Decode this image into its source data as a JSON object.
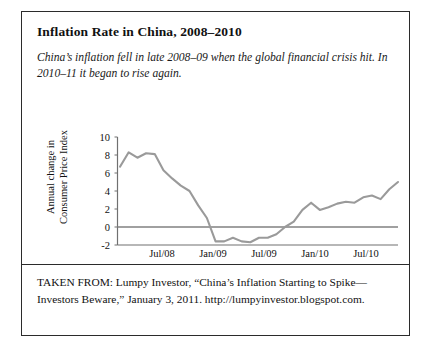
{
  "figure": {
    "title": "Inflation Rate in China, 2008–2010",
    "caption": "China’s inflation fell in late 2008–09 when the global financial crisis hit. In 2010–11 it began to rise again.",
    "source_note": "TAKEN FROM: Lumpy Investor, “China’s Inflation Starting to Spike—Investors Beware,” January 3, 2011. http://lumpyinvestor.blogspot.com.",
    "border_color": "#2b2b2b",
    "background_color": "#ffffff"
  },
  "chart_data": {
    "type": "line",
    "title": "Inflation Rate in China, 2008–2010",
    "xlabel": "",
    "ylabel": "Annual change in Consumer Price Index",
    "ylabel_line1": "Annual change in",
    "ylabel_line2": "Consumer Price Index",
    "ylim": [
      -2,
      10
    ],
    "yticks": [
      10,
      8,
      6,
      4,
      2,
      0,
      -2
    ],
    "ytick_labels": [
      "10",
      "8",
      "6",
      "4",
      "2",
      "0",
      "-2"
    ],
    "xtick_labels": [
      "Jul/08",
      "Jan/09",
      "Jul/09",
      "Jan/10",
      "Jul/10"
    ],
    "xtick_months": [
      "2008-07",
      "2009-01",
      "2009-07",
      "2010-01",
      "2010-07"
    ],
    "xlim": [
      "2008-03",
      "2010-12"
    ],
    "grid": false,
    "legend": false,
    "zero_line": true,
    "line_color": "#9a9a9a",
    "axis_color": "#707070",
    "series": [
      {
        "name": "Annual change in Consumer Price Index",
        "x": [
          "2008-03",
          "2008-04",
          "2008-05",
          "2008-06",
          "2008-07",
          "2008-08",
          "2008-09",
          "2008-10",
          "2008-11",
          "2008-12",
          "2009-01",
          "2009-02",
          "2009-03",
          "2009-04",
          "2009-05",
          "2009-06",
          "2009-07",
          "2009-08",
          "2009-09",
          "2009-10",
          "2009-11",
          "2009-12",
          "2010-01",
          "2010-02",
          "2010-03",
          "2010-04",
          "2010-05",
          "2010-06",
          "2010-07",
          "2010-08",
          "2010-09",
          "2010-10",
          "2010-11"
        ],
        "values": [
          6.7,
          8.3,
          7.7,
          8.2,
          8.1,
          6.3,
          5.4,
          4.6,
          4.0,
          2.4,
          1.0,
          -1.6,
          -1.6,
          -1.2,
          -1.6,
          -1.7,
          -1.2,
          -1.2,
          -0.8,
          0.0,
          0.6,
          1.9,
          2.7,
          1.9,
          2.2,
          2.6,
          2.8,
          2.7,
          3.3,
          3.5,
          3.1,
          4.2,
          5.0
        ]
      }
    ]
  }
}
